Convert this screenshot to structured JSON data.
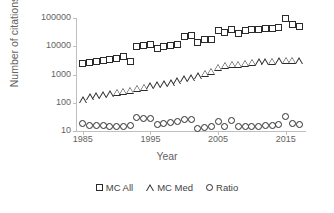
{
  "chart_data": {
    "type": "scatter",
    "title": "",
    "xlabel": "Year",
    "ylabel": "Number of citations",
    "yscale": "log",
    "ylim": [
      10,
      100000
    ],
    "xlim": [
      1984,
      2018
    ],
    "grid": false,
    "legend_position": "bottom",
    "y_ticks": [
      "100000",
      "10000",
      "1000",
      "100",
      "10"
    ],
    "y_tick_values": [
      100000,
      10000,
      1000,
      100,
      10
    ],
    "x_ticks": [
      "1985",
      "1995",
      "2005",
      "2015"
    ],
    "x_tick_values": [
      1985,
      1995,
      2005,
      2015
    ],
    "x": [
      1985,
      1986,
      1987,
      1988,
      1989,
      1990,
      1991,
      1992,
      1993,
      1994,
      1995,
      1996,
      1997,
      1998,
      1999,
      2000,
      2001,
      2002,
      2003,
      2004,
      2005,
      2006,
      2007,
      2008,
      2009,
      2010,
      2011,
      2012,
      2013,
      2014,
      2015,
      2016,
      2017
    ],
    "series": [
      {
        "name": "MC All",
        "marker": "square",
        "values": [
          2500,
          2700,
          2900,
          3100,
          3300,
          3600,
          4300,
          2800,
          10000,
          10500,
          11500,
          8000,
          9500,
          11000,
          11500,
          23000,
          24000,
          14000,
          17000,
          18000,
          35000,
          31000,
          40000,
          28000,
          35000,
          38000,
          40000,
          42000,
          44000,
          46000,
          100000,
          60000,
          52000
        ]
      },
      {
        "name": "MC Med",
        "marker": "triangle",
        "values": [
          130,
          165,
          180,
          195,
          210,
          235,
          260,
          280,
          330,
          360,
          400,
          430,
          470,
          520,
          600,
          700,
          760,
          900,
          1100,
          1300,
          1800,
          2100,
          2300,
          2350,
          2500,
          2700,
          2800,
          2900,
          3000,
          3100,
          3200,
          3200,
          3100
        ]
      },
      {
        "name": "Ratio",
        "marker": "circle",
        "values": [
          18,
          16,
          16,
          16,
          15,
          14,
          14,
          16,
          29,
          28,
          27,
          17,
          18,
          20,
          21,
          26,
          25,
          12,
          13,
          14,
          21,
          15,
          23,
          15,
          15,
          15,
          15,
          16,
          16,
          17,
          33,
          18,
          17
        ]
      }
    ]
  },
  "legend": {
    "items": [
      {
        "label": "MC All",
        "marker": "square"
      },
      {
        "label": "MC Med",
        "marker": "triangle"
      },
      {
        "label": "Ratio",
        "marker": "circle"
      }
    ]
  }
}
